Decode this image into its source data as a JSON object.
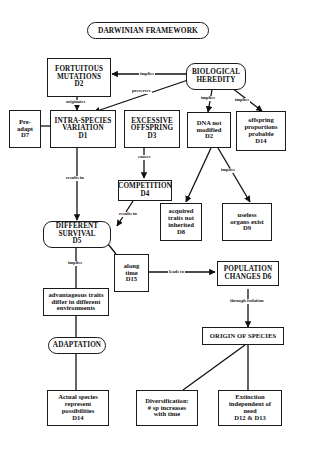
{
  "title": "DARWINIAN FRAMEWORK",
  "nodes": {
    "fortuitous_mutations": "FORTUITOUS\nMUTATIONS\nD2",
    "biological_heredity": "BIOLOGICAL\nHEREDITY",
    "pre_adapt": "Pre-\nadapt\nD7",
    "intra_species_variation": "INTRA-SPECIES\nVARIATION\nD1",
    "excessive_offspring": "EXCESSIVE\nOFFSPRING\nD3",
    "dna_not_modified": "DNA not\nmodified\nD2",
    "offspring_proportions": "offspring\nproportions\nprobable\nD14",
    "competition": "COMPETITION\nD4",
    "acquired_traits": "acquired\ntraits not\ninherited\nD8",
    "useless_organs": "useless\norgans exist\nD9",
    "different_survival": "DIFFERENT\nSURVIVAL\nD5",
    "along_time": "along\ntime\nD15",
    "population_changes": "POPULATION\nCHANGES  D6",
    "advantageous_traits": "advantageous traits\ndiffer in different\nenvironments",
    "adaptation": "ADAPTATION",
    "origin_of_species": "ORIGIN OF SPECIES",
    "actual_species": "Actual species\nrepresent\npossibilities\nD14",
    "diversification": "Diversification:\n# sp increases\nwith time",
    "extinction": "Extinction\nindependent of\nneed\nD12 & D13"
  },
  "links": {
    "heredity_implies_mutations": "implies",
    "heredity_preserves_variation": "preserves",
    "mutations_originates_variation": "originates",
    "heredity_implies_dna": "implies",
    "heredity_implies_offspring": "implies",
    "offspring_causes_competition": "causes",
    "variation_results_in_survival": "results in",
    "competition_results_in_survival": "results in",
    "dna_implies_organs": "implies",
    "survival_implies_traits": "implies",
    "time_leads_to_population": "leads to",
    "population_through_isolation": "through isolation"
  }
}
